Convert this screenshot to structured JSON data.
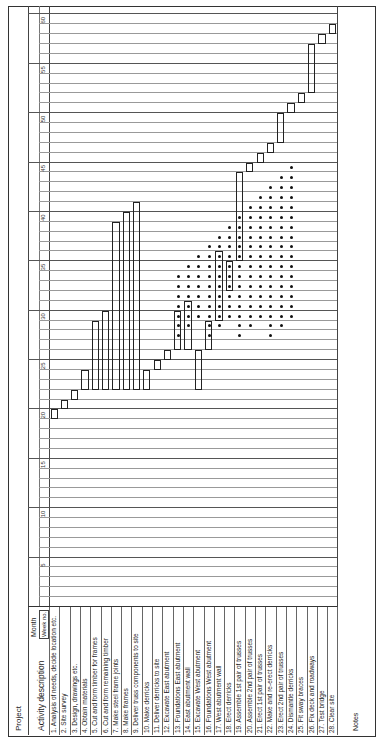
{
  "header": {
    "project_label": "Project",
    "activity_header": "Activity description",
    "month_label": "Month",
    "week_label": "Week no.",
    "notes_label": "Notes"
  },
  "chart_data": {
    "type": "gantt",
    "xlabel": "Week no.",
    "ylabel": "Activity description",
    "x_ticks": [
      5,
      10,
      15,
      20,
      25,
      30,
      35,
      40,
      45,
      50,
      55,
      60
    ],
    "xlim": [
      0,
      60
    ],
    "grid": true,
    "activities": [
      {
        "id": 1,
        "label": "1. Analysis of needs, decide location etc.",
        "start": 19,
        "end": 20
      },
      {
        "id": 2,
        "label": "2. Site survey",
        "start": 20,
        "end": 21
      },
      {
        "id": 3,
        "label": "3. Design, drawings etc.",
        "start": 21,
        "end": 22
      },
      {
        "id": 4,
        "label": "4. Obtain materials",
        "start": 22,
        "end": 24
      },
      {
        "id": 5,
        "label": "5. Cut and form timber for frames",
        "start": 22,
        "end": 29
      },
      {
        "id": 6,
        "label": "6. Cut and form remaining timber",
        "start": 22,
        "end": 30
      },
      {
        "id": 7,
        "label": "7. Make steel frame joints",
        "start": 22,
        "end": 39
      },
      {
        "id": 8,
        "label": "8. Make frames",
        "start": 22,
        "end": 40
      },
      {
        "id": 9,
        "label": "9. Deliver truss components to site",
        "start": 22,
        "end": 41
      },
      {
        "id": 10,
        "label": "10. Make derricks",
        "start": 22,
        "end": 24
      },
      {
        "id": 11,
        "label": "11. Deliver derricks to site",
        "start": 24,
        "end": 25
      },
      {
        "id": 12,
        "label": "12. Excavate East abutment",
        "start": 25,
        "end": 26
      },
      {
        "id": 13,
        "label": "13. Foundations East abutment",
        "start": 26,
        "end": 30
      },
      {
        "id": 14,
        "label": "14. East abutment wall",
        "start": 26,
        "end": 31
      },
      {
        "id": 15,
        "label": "15. Excavate West abutment",
        "start": 22,
        "end": 26
      },
      {
        "id": 16,
        "label": "16. Foundations West abutment",
        "start": 26,
        "end": 29
      },
      {
        "id": 17,
        "label": "17. West abutment wall",
        "start": 29,
        "end": 36
      },
      {
        "id": 18,
        "label": "18. Erect derricks",
        "start": 32,
        "end": 35
      },
      {
        "id": 19,
        "label": "19. Assemble 1st pair of trusses",
        "start": 35,
        "end": 44
      },
      {
        "id": 20,
        "label": "20. Assemble 2nd pair of trusses",
        "start": 44,
        "end": 45
      },
      {
        "id": 21,
        "label": "21. Erect 1st pair of trusses",
        "start": 45,
        "end": 46
      },
      {
        "id": 22,
        "label": "22. Make and re-erect derricks",
        "start": 46,
        "end": 47
      },
      {
        "id": 23,
        "label": "23. Erect 2nd pair of trusses",
        "start": 47,
        "end": 50
      },
      {
        "id": 24,
        "label": "24. Dismantle derricks",
        "start": 50,
        "end": 51
      },
      {
        "id": 25,
        "label": "25. Fit sway braces",
        "start": 51,
        "end": 52
      },
      {
        "id": 26,
        "label": "26. Fix deck and roadways",
        "start": 52,
        "end": 57
      },
      {
        "id": 27,
        "label": "27. Test bridge",
        "start": 57,
        "end": 58
      },
      {
        "id": 28,
        "label": "28. Clear site",
        "start": 58,
        "end": 59
      }
    ]
  }
}
